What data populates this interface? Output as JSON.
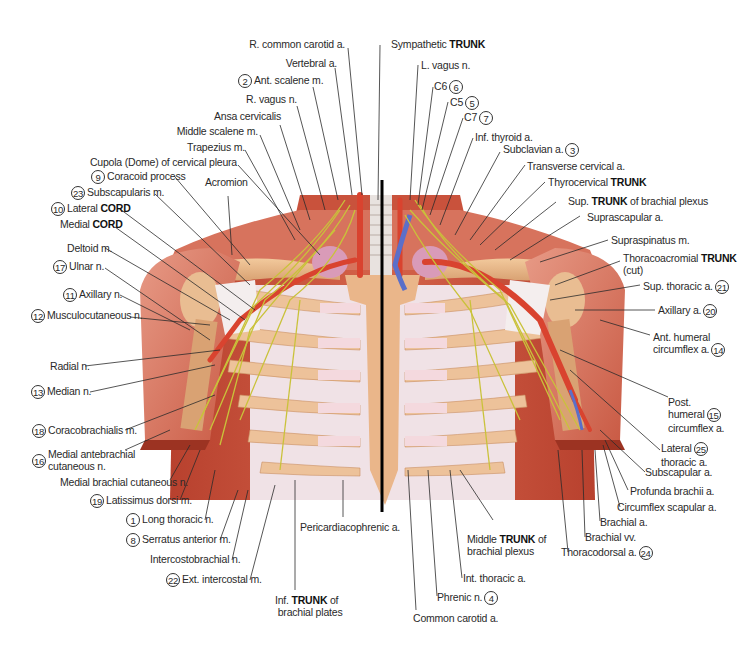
{
  "figure": {
    "colors": {
      "muscle": "#c9523c",
      "muscle_light": "#e38a74",
      "bone": "#e9b98a",
      "cartilage": "#f1d8dc",
      "fascia": "#f5eef0",
      "nerve": "#c9c23a",
      "artery": "#d9432f",
      "vein": "#5b6fc9",
      "lung": "#d99bb8",
      "leader_line": "#2b2b2b",
      "midline": "#000000"
    }
  },
  "labels_top": [
    {
      "num": "",
      "text": "R. common carotid a."
    },
    {
      "num": "",
      "text": "Vertebral a."
    },
    {
      "num": "2",
      "text": "Ant. scalene m."
    },
    {
      "num": "",
      "text": "R. vagus n."
    },
    {
      "num": "",
      "text": "Ansa cervicalis"
    },
    {
      "num": "",
      "text": "Middle scalene m."
    },
    {
      "num": "",
      "text": "Trapezius m."
    },
    {
      "num": "",
      "text": "Cupola (Dome) of cervical pleura"
    }
  ],
  "labels_top_right": [
    {
      "num": "",
      "text": "Sympathetic",
      "bold": "TRUNK"
    },
    {
      "num": "",
      "text": "L. vagus n."
    },
    {
      "num": "6",
      "text": "C6"
    },
    {
      "num": "5",
      "text": "C5"
    },
    {
      "num": "7",
      "text": "C7"
    },
    {
      "num": "",
      "text": "Inf. thyroid a."
    },
    {
      "num": "3",
      "text": "Subclavian a."
    },
    {
      "num": "",
      "text": "Transverse cervical a."
    }
  ],
  "labels_left": [
    {
      "num": "9",
      "text": "Coracoid process"
    },
    {
      "num": "",
      "text": "Acromion"
    },
    {
      "num": "23",
      "text": "Subscapularis m."
    },
    {
      "num": "10",
      "text": "Lateral",
      "bold": "CORD"
    },
    {
      "num": "",
      "text": "Medial",
      "bold": "CORD"
    },
    {
      "num": "",
      "text": "Deltoid m."
    },
    {
      "num": "17",
      "text": "Ulnar n."
    },
    {
      "num": "11",
      "text": "Axillary n."
    },
    {
      "num": "12",
      "text": "Musculocutaneous n."
    },
    {
      "num": "",
      "text": "Radial n."
    },
    {
      "num": "13",
      "text": "Median n."
    },
    {
      "num": "18",
      "text": "Coracobrachialis m."
    },
    {
      "num": "16",
      "text": "Medial antebrachial",
      "text2": "cutaneous n."
    },
    {
      "num": "",
      "text": "Medial brachial cutaneous n."
    },
    {
      "num": "19",
      "text": "Latissimus dorsi m."
    },
    {
      "num": "1",
      "text": "Long thoracic n."
    },
    {
      "num": "8",
      "text": "Serratus anterior m."
    },
    {
      "num": "",
      "text": "Intercostobrachial n."
    },
    {
      "num": "22",
      "text": "Ext. intercostal m."
    }
  ],
  "labels_right": [
    {
      "num": "",
      "text": "Thyrocervical",
      "bold": "TRUNK"
    },
    {
      "num": "",
      "text": "Sup.",
      "bold": "TRUNK",
      "text_after": "of brachial plexus"
    },
    {
      "num": "",
      "text": "Suprascapular a."
    },
    {
      "num": "",
      "text": "Supraspinatus m."
    },
    {
      "num": "",
      "text": "Thoracoacromial",
      "bold": "TRUNK",
      "text2": "(cut)"
    },
    {
      "num": "21",
      "text": "Sup. thoracic a."
    },
    {
      "num": "20",
      "text": "Axillary a."
    },
    {
      "num": "14",
      "text": "Ant. humeral",
      "text2": "circumflex a."
    },
    {
      "num": "15",
      "text": "Post.",
      "text2": "humeral",
      "text3": "circumflex a."
    },
    {
      "num": "25",
      "text": "Lateral",
      "text2": "thoracic a."
    },
    {
      "num": "",
      "text": "Subscapular a."
    },
    {
      "num": "",
      "text": "Profunda brachii a."
    },
    {
      "num": "",
      "text": "Circumflex scapular a."
    },
    {
      "num": "",
      "text": "Brachial a."
    },
    {
      "num": "",
      "text": "Brachial vv."
    },
    {
      "num": "24",
      "text": "Thoracodorsal a."
    }
  ],
  "labels_bottom": [
    {
      "num": "",
      "text": "Pericardiacophrenic a."
    },
    {
      "num": "",
      "text": "Inf.",
      "bold": "TRUNK",
      "text_after": "of",
      "text2": "brachial plates"
    },
    {
      "num": "",
      "text": "Middle",
      "bold": "TRUNK",
      "text_after": "of",
      "text2": "brachial plexus"
    },
    {
      "num": "",
      "text": "Int. thoracic a."
    },
    {
      "num": "4",
      "text": "Phrenic n."
    },
    {
      "num": "",
      "text": "Common carotid a."
    }
  ]
}
